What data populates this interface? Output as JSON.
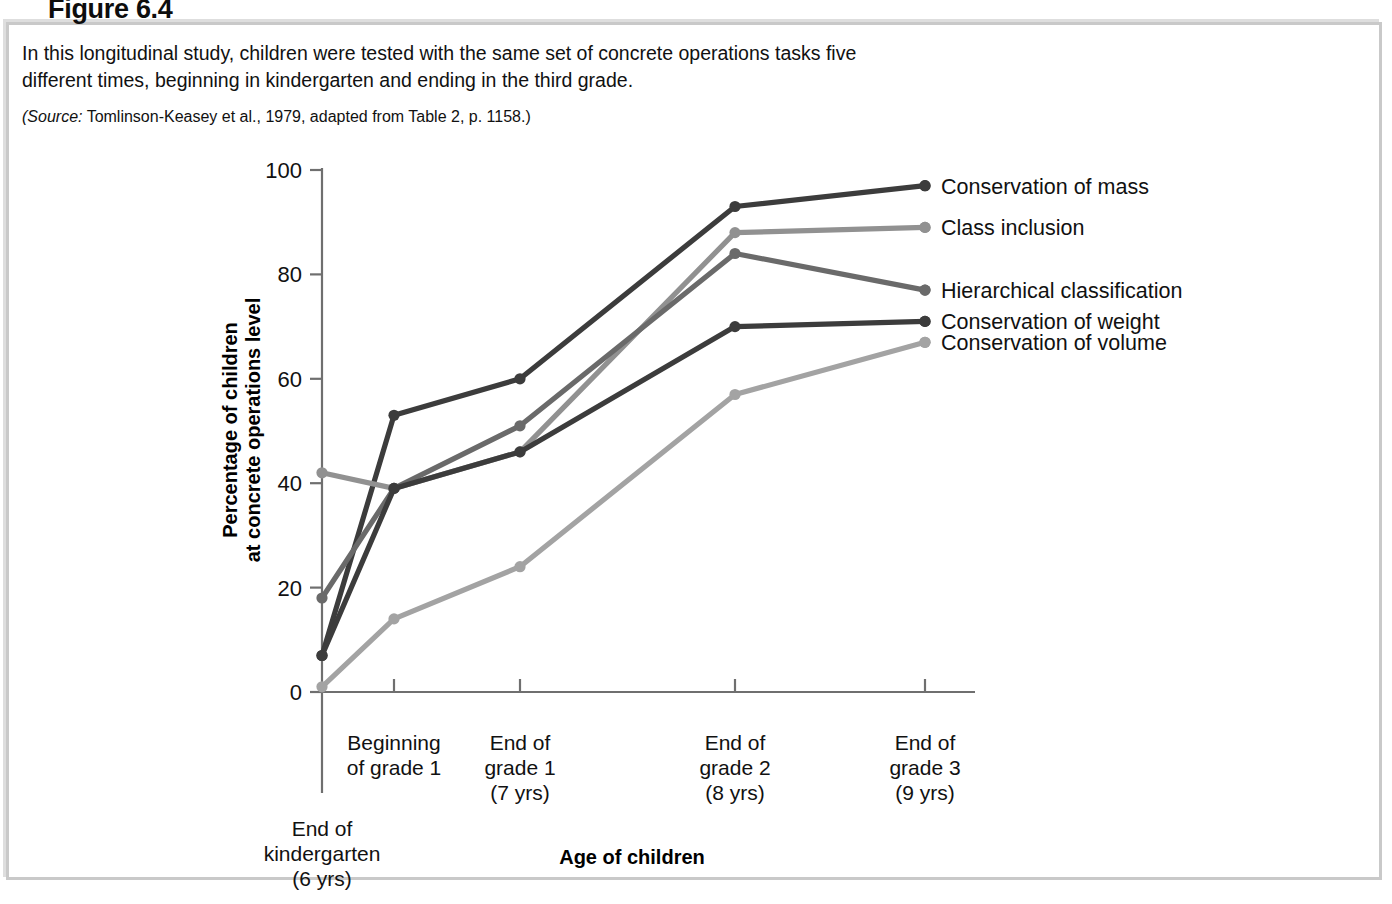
{
  "figure": {
    "heading": "Figure 6.4",
    "caption_line_1": "In this longitudinal study, children were tested with the same set of concrete operations tasks five",
    "caption_line_2": "different times, beginning in kindergarten and ending in the third grade.",
    "source_prefix": "(Source:",
    "source_text": " Tomlinson-Keasey et al., 1979, adapted from Table 2, p. 1158.)"
  },
  "chart_data": {
    "type": "line",
    "title": "",
    "xlabel": "Age of children",
    "ylabel": "Percentage of children\nat concrete operations level",
    "ylabel_line_1": "Percentage of children",
    "ylabel_line_2": "at concrete operations level",
    "ylim": [
      0,
      100
    ],
    "yticks": [
      0,
      20,
      40,
      60,
      80,
      100
    ],
    "ytick_labels": [
      "0",
      "20",
      "40",
      "60",
      "80",
      "100"
    ],
    "grid": false,
    "legend_position": "right-of-plot",
    "categories": [
      "End of kindergarten (6 yrs)",
      "Beginning of grade 1",
      "End of grade 1 (7 yrs)",
      "End of grade 2 (8 yrs)",
      "End of grade 3 (9 yrs)"
    ],
    "category_labels": [
      {
        "line1": "End of",
        "line2": "kindergarten",
        "line3": "(6 yrs)"
      },
      {
        "line1": "Beginning",
        "line2": "of grade 1",
        "line3": ""
      },
      {
        "line1": "End of",
        "line2": "grade 1",
        "line3": "(7 yrs)"
      },
      {
        "line1": "End of",
        "line2": "grade 2",
        "line3": "(8 yrs)"
      },
      {
        "line1": "End of",
        "line2": "grade 3",
        "line3": "(9 yrs)"
      }
    ],
    "series": [
      {
        "name": "Conservation of mass",
        "values": [
          7,
          53,
          60,
          93,
          97
        ],
        "color": "#3c3c3c"
      },
      {
        "name": "Class inclusion",
        "values": [
          42,
          39,
          46,
          88,
          89
        ],
        "color": "#919191"
      },
      {
        "name": "Hierarchical classification",
        "values": [
          18,
          39,
          51,
          84,
          77
        ],
        "color": "#6a6a6a"
      },
      {
        "name": "Conservation of weight",
        "values": [
          7,
          39,
          46,
          70,
          71
        ],
        "color": "#3c3c3c"
      },
      {
        "name": "Conservation of volume",
        "values": [
          1,
          14,
          24,
          57,
          67
        ],
        "color": "#a3a3a3"
      }
    ]
  },
  "legend": {
    "items": [
      {
        "label": "Conservation of mass",
        "color": "#3c3c3c"
      },
      {
        "label": "Class inclusion",
        "color": "#919191"
      },
      {
        "label": "Hierarchical classification",
        "color": "#6a6a6a"
      },
      {
        "label": "Conservation of weight",
        "color": "#3c3c3c"
      },
      {
        "label": "Conservation of volume",
        "color": "#a3a3a3"
      }
    ]
  }
}
